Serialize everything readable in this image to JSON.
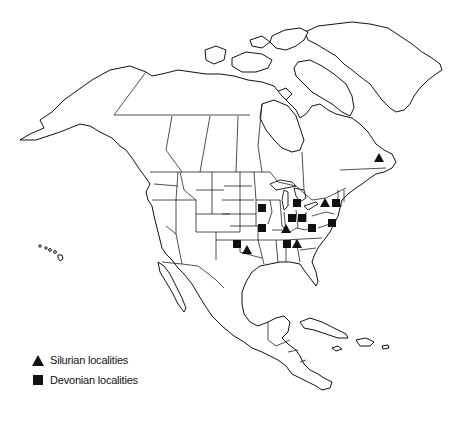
{
  "map": {
    "title": "North America fossil localities",
    "region": "North America",
    "marker_color": "#111111",
    "legend": [
      {
        "symbol": "triangle",
        "label": "Silurian localities"
      },
      {
        "symbol": "square",
        "label": "Devonian localities"
      }
    ],
    "localities": [
      {
        "period": "Silurian",
        "symbol": "triangle",
        "region": "Quebec (Gaspé)"
      },
      {
        "period": "Silurian",
        "symbol": "triangle",
        "region": "New York"
      },
      {
        "period": "Devonian",
        "symbol": "square",
        "region": "New York"
      },
      {
        "period": "Devonian",
        "symbol": "square",
        "region": "Maryland / Virginia"
      },
      {
        "period": "Devonian",
        "symbol": "square",
        "region": "Michigan"
      },
      {
        "period": "Devonian",
        "symbol": "square",
        "region": "Indiana"
      },
      {
        "period": "Devonian",
        "symbol": "square",
        "region": "Ohio"
      },
      {
        "period": "Devonian",
        "symbol": "square",
        "region": "West Virginia"
      },
      {
        "period": "Silurian",
        "symbol": "triangle",
        "region": "Kentucky"
      },
      {
        "period": "Devonian",
        "symbol": "square",
        "region": "Iowa"
      },
      {
        "period": "Devonian",
        "symbol": "square",
        "region": "Missouri"
      },
      {
        "period": "Devonian",
        "symbol": "square",
        "region": "Tennessee"
      },
      {
        "period": "Silurian",
        "symbol": "triangle",
        "region": "Tennessee"
      },
      {
        "period": "Devonian",
        "symbol": "square",
        "region": "Oklahoma"
      },
      {
        "period": "Silurian",
        "symbol": "triangle",
        "region": "Oklahoma"
      }
    ]
  }
}
